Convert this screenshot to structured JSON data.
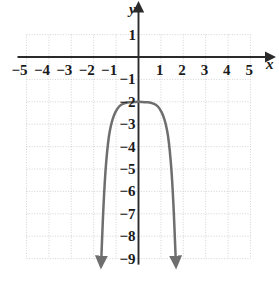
{
  "chart_data": {
    "type": "line",
    "title": "",
    "xlabel": "x",
    "ylabel": "y",
    "xlim": [
      -5,
      5
    ],
    "ylim": [
      -9,
      1
    ],
    "grid": true,
    "legend": null,
    "x_ticks": [
      {
        "value": -5,
        "label": "−5"
      },
      {
        "value": -4,
        "label": "−4"
      },
      {
        "value": -3,
        "label": "−3"
      },
      {
        "value": -2,
        "label": "−2"
      },
      {
        "value": -1,
        "label": "−1"
      },
      {
        "value": 1,
        "label": "1"
      },
      {
        "value": 2,
        "label": "2"
      },
      {
        "value": 3,
        "label": "3"
      },
      {
        "value": 4,
        "label": "4"
      },
      {
        "value": 5,
        "label": "5"
      }
    ],
    "y_ticks": [
      {
        "value": 1,
        "label": "1"
      },
      {
        "value": -1,
        "label": "−1"
      },
      {
        "value": -2,
        "label": "−2"
      },
      {
        "value": -3,
        "label": "−3"
      },
      {
        "value": -4,
        "label": "−4"
      },
      {
        "value": -5,
        "label": "−5"
      },
      {
        "value": -6,
        "label": "−6"
      },
      {
        "value": -7,
        "label": "−7"
      },
      {
        "value": -8,
        "label": "−8"
      },
      {
        "value": -9,
        "label": "−9"
      }
    ],
    "series": [
      {
        "name": "curve",
        "description": "Downward even-degree polynomial with flat plateau vertex at (0, -2), steep symmetric branches ending in downward arrowheads at y = -9",
        "color": "#6e6e6e",
        "vertex": [
          0,
          -2
        ],
        "arrow_ends": [
          [
            -1.66,
            -9
          ],
          [
            1.66,
            -9
          ]
        ],
        "points": [
          [
            -1.66,
            -9.0
          ],
          [
            -1.62,
            -8.0
          ],
          [
            -1.58,
            -7.0
          ],
          [
            -1.53,
            -6.0
          ],
          [
            -1.47,
            -5.0
          ],
          [
            -1.4,
            -4.2
          ],
          [
            -1.32,
            -3.5
          ],
          [
            -1.22,
            -3.0
          ],
          [
            -1.1,
            -2.6
          ],
          [
            -0.95,
            -2.3
          ],
          [
            -0.78,
            -2.12
          ],
          [
            -0.55,
            -2.04
          ],
          [
            -0.3,
            -2.01
          ],
          [
            0.0,
            -2.0
          ],
          [
            0.3,
            -2.01
          ],
          [
            0.55,
            -2.04
          ],
          [
            0.78,
            -2.12
          ],
          [
            0.95,
            -2.3
          ],
          [
            1.1,
            -2.6
          ],
          [
            1.22,
            -3.0
          ],
          [
            1.32,
            -3.5
          ],
          [
            1.4,
            -4.2
          ],
          [
            1.47,
            -5.0
          ],
          [
            1.53,
            -6.0
          ],
          [
            1.58,
            -7.0
          ],
          [
            1.62,
            -8.0
          ],
          [
            1.66,
            -9.0
          ]
        ]
      }
    ]
  },
  "colors": {
    "curve": "#6e6e6e",
    "axis": "#2b2b2b",
    "grid": "#c8c8c8",
    "label": "#1a1a1a",
    "background": "#ffffff"
  }
}
